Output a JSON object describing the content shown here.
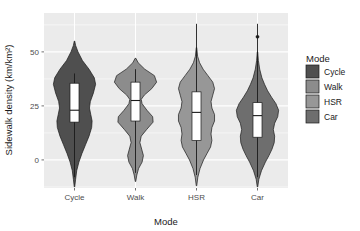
{
  "chart_data": {
    "type": "violin",
    "title": "",
    "xlabel": "Mode",
    "ylabel": "Sidewalk density (km/km²)",
    "categories": [
      "Cycle",
      "Walk",
      "HSR",
      "Car"
    ],
    "ylim": [
      -13,
      68
    ],
    "yticks": [
      0,
      25,
      50
    ],
    "ytick_labels": [
      "0",
      "25",
      "50"
    ],
    "grid": true,
    "grid_color": "#ffffff",
    "panel_background": "#ebebeb",
    "legend": {
      "title": "Mode",
      "position": "right",
      "entries": [
        {
          "label": "Cycle",
          "color": "#4f4f4f"
        },
        {
          "label": "Walk",
          "color": "#8c8c8c"
        },
        {
          "label": "HSR",
          "color": "#979797"
        },
        {
          "label": "Car",
          "color": "#6e6e6e"
        }
      ]
    },
    "series": [
      {
        "name": "Cycle",
        "color": "#4f4f4f",
        "box": {
          "lower_whisker": -8.0,
          "q1": 17.5,
          "median": 23.0,
          "q3": 35.5,
          "upper_whisker": 4.5
        },
        "whisker_low": -8.0,
        "whisker_high": 40.0,
        "outliers": [],
        "density": [
          {
            "y": -12.5,
            "w": 0.01
          },
          {
            "y": -9.0,
            "w": 0.05
          },
          {
            "y": -5.0,
            "w": 0.1
          },
          {
            "y": -1.0,
            "w": 0.2
          },
          {
            "y": 3.0,
            "w": 0.34
          },
          {
            "y": 7.0,
            "w": 0.5
          },
          {
            "y": 11.0,
            "w": 0.66
          },
          {
            "y": 15.0,
            "w": 0.78
          },
          {
            "y": 18.0,
            "w": 0.8
          },
          {
            "y": 21.0,
            "w": 0.74
          },
          {
            "y": 24.0,
            "w": 0.68
          },
          {
            "y": 27.0,
            "w": 0.72
          },
          {
            "y": 31.0,
            "w": 0.86
          },
          {
            "y": 35.0,
            "w": 0.96
          },
          {
            "y": 38.0,
            "w": 0.9
          },
          {
            "y": 42.0,
            "w": 0.66
          },
          {
            "y": 46.0,
            "w": 0.36
          },
          {
            "y": 50.0,
            "w": 0.16
          },
          {
            "y": 53.0,
            "w": 0.05
          },
          {
            "y": 55.0,
            "w": 0.01
          }
        ]
      },
      {
        "name": "Walk",
        "color": "#8c8c8c",
        "box": {
          "lower_whisker": -6.0,
          "q1": 18.0,
          "median": 27.5,
          "q3": 36.0,
          "upper_whisker": 0.5
        },
        "whisker_low": -6.0,
        "whisker_high": 42.0,
        "outliers": [],
        "density": [
          {
            "y": -10.0,
            "w": 0.01
          },
          {
            "y": -7.0,
            "w": 0.06
          },
          {
            "y": -4.0,
            "w": 0.14
          },
          {
            "y": -1.0,
            "w": 0.3
          },
          {
            "y": 2.0,
            "w": 0.36
          },
          {
            "y": 5.0,
            "w": 0.28
          },
          {
            "y": 8.0,
            "w": 0.2
          },
          {
            "y": 11.0,
            "w": 0.26
          },
          {
            "y": 14.0,
            "w": 0.5
          },
          {
            "y": 17.5,
            "w": 0.8
          },
          {
            "y": 20.0,
            "w": 0.78
          },
          {
            "y": 23.0,
            "w": 0.52
          },
          {
            "y": 26.0,
            "w": 0.3
          },
          {
            "y": 28.0,
            "w": 0.26
          },
          {
            "y": 30.0,
            "w": 0.4
          },
          {
            "y": 33.0,
            "w": 0.74
          },
          {
            "y": 36.0,
            "w": 0.96
          },
          {
            "y": 39.0,
            "w": 0.86
          },
          {
            "y": 42.0,
            "w": 0.42
          },
          {
            "y": 45.0,
            "w": 0.12
          },
          {
            "y": 47.0,
            "w": 0.02
          }
        ]
      },
      {
        "name": "HSR",
        "color": "#979797",
        "box": {
          "lower_whisker": -7.0,
          "q1": 9.0,
          "median": 22.0,
          "q3": 31.5,
          "upper_whisker": 2.0
        },
        "whisker_low": -7.0,
        "whisker_high": 63.0,
        "outliers": [],
        "density": [
          {
            "y": -12.0,
            "w": 0.01
          },
          {
            "y": -8.0,
            "w": 0.06
          },
          {
            "y": -4.0,
            "w": 0.16
          },
          {
            "y": 0.0,
            "w": 0.32
          },
          {
            "y": 3.0,
            "w": 0.48
          },
          {
            "y": 6.0,
            "w": 0.64
          },
          {
            "y": 9.0,
            "w": 0.7
          },
          {
            "y": 12.0,
            "w": 0.66
          },
          {
            "y": 15.0,
            "w": 0.7
          },
          {
            "y": 18.0,
            "w": 0.82
          },
          {
            "y": 21.0,
            "w": 0.82
          },
          {
            "y": 24.0,
            "w": 0.7
          },
          {
            "y": 27.0,
            "w": 0.66
          },
          {
            "y": 30.0,
            "w": 0.74
          },
          {
            "y": 33.0,
            "w": 0.82
          },
          {
            "y": 36.0,
            "w": 0.74
          },
          {
            "y": 39.0,
            "w": 0.52
          },
          {
            "y": 42.0,
            "w": 0.3
          },
          {
            "y": 45.0,
            "w": 0.14
          },
          {
            "y": 48.0,
            "w": 0.05
          },
          {
            "y": 52.0,
            "w": 0.01
          }
        ]
      },
      {
        "name": "Car",
        "color": "#6e6e6e",
        "box": {
          "lower_whisker": -8.0,
          "q1": 10.5,
          "median": 20.5,
          "q3": 26.5,
          "upper_whisker": 0.0
        },
        "whisker_low": -8.0,
        "whisker_high": 63.0,
        "outliers": [
          57.0
        ],
        "density": [
          {
            "y": -12.5,
            "w": 0.01
          },
          {
            "y": -9.0,
            "w": 0.06
          },
          {
            "y": -5.0,
            "w": 0.18
          },
          {
            "y": -1.0,
            "w": 0.36
          },
          {
            "y": 2.0,
            "w": 0.52
          },
          {
            "y": 5.0,
            "w": 0.66
          },
          {
            "y": 8.0,
            "w": 0.76
          },
          {
            "y": 11.0,
            "w": 0.78
          },
          {
            "y": 14.0,
            "w": 0.72
          },
          {
            "y": 17.0,
            "w": 0.78
          },
          {
            "y": 20.0,
            "w": 0.92
          },
          {
            "y": 23.0,
            "w": 0.96
          },
          {
            "y": 26.0,
            "w": 0.84
          },
          {
            "y": 29.0,
            "w": 0.64
          },
          {
            "y": 32.0,
            "w": 0.46
          },
          {
            "y": 35.0,
            "w": 0.32
          },
          {
            "y": 38.0,
            "w": 0.2
          },
          {
            "y": 42.0,
            "w": 0.1
          },
          {
            "y": 46.0,
            "w": 0.04
          },
          {
            "y": 50.0,
            "w": 0.01
          }
        ]
      }
    ]
  },
  "layout": {
    "panel": {
      "x": 44,
      "y": 13,
      "width": 244,
      "height": 175
    },
    "violin_half_width": 22,
    "box_width": 9,
    "legend": {
      "x": 306,
      "y": 65,
      "swatch": 13,
      "gap": 2
    }
  }
}
